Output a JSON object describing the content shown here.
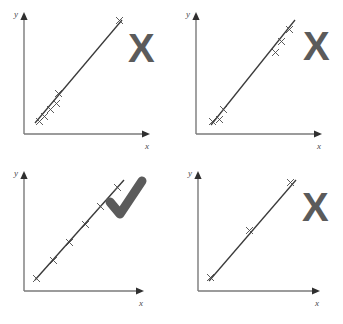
{
  "figure": {
    "title_caption": "",
    "background_color": "#ffffff",
    "line_color": "#3a3a3a",
    "axis_color": "#7a7a7a",
    "mark_color": "#5b5b5b",
    "point_marker": "x",
    "axis_labels": {
      "x": "x",
      "y": "y"
    },
    "panels": [
      {
        "id": "panel-top-left",
        "verdict": "incorrect",
        "verdict_glyph": "X",
        "description": "clustered points with one distant point",
        "points": [
          {
            "x": 0.13,
            "y": 0.14
          },
          {
            "x": 0.17,
            "y": 0.18
          },
          {
            "x": 0.21,
            "y": 0.24
          },
          {
            "x": 0.25,
            "y": 0.29
          },
          {
            "x": 0.29,
            "y": 0.37
          },
          {
            "x": 0.86,
            "y": 0.94
          }
        ],
        "line": {
          "x1": 0.1,
          "y1": 0.1,
          "x2": 0.89,
          "y2": 0.97
        }
      },
      {
        "id": "panel-top-right",
        "verdict": "incorrect",
        "verdict_glyph": "X",
        "description": "two separated clusters at the extremes",
        "points": [
          {
            "x": 0.16,
            "y": 0.13
          },
          {
            "x": 0.21,
            "y": 0.16
          },
          {
            "x": 0.25,
            "y": 0.25
          },
          {
            "x": 0.74,
            "y": 0.74
          },
          {
            "x": 0.79,
            "y": 0.83
          },
          {
            "x": 0.84,
            "y": 0.92
          }
        ],
        "line": {
          "x1": 0.13,
          "y1": 0.09,
          "x2": 0.88,
          "y2": 0.96
        }
      },
      {
        "id": "panel-bottom-left",
        "verdict": "correct",
        "verdict_glyph": "check",
        "description": "points evenly spread across the whole range",
        "points": [
          {
            "x": 0.12,
            "y": 0.1
          },
          {
            "x": 0.27,
            "y": 0.26
          },
          {
            "x": 0.42,
            "y": 0.43
          },
          {
            "x": 0.57,
            "y": 0.59
          },
          {
            "x": 0.71,
            "y": 0.75
          },
          {
            "x": 0.85,
            "y": 0.92
          }
        ],
        "line": {
          "x1": 0.09,
          "y1": 0.07,
          "x2": 0.89,
          "y2": 0.96
        }
      },
      {
        "id": "panel-bottom-right",
        "verdict": "incorrect",
        "verdict_glyph": "X",
        "description": "too few points",
        "points": [
          {
            "x": 0.14,
            "y": 0.1
          },
          {
            "x": 0.5,
            "y": 0.51
          },
          {
            "x": 0.85,
            "y": 0.93
          }
        ],
        "line": {
          "x1": 0.11,
          "y1": 0.07,
          "x2": 0.89,
          "y2": 0.96
        }
      }
    ]
  }
}
